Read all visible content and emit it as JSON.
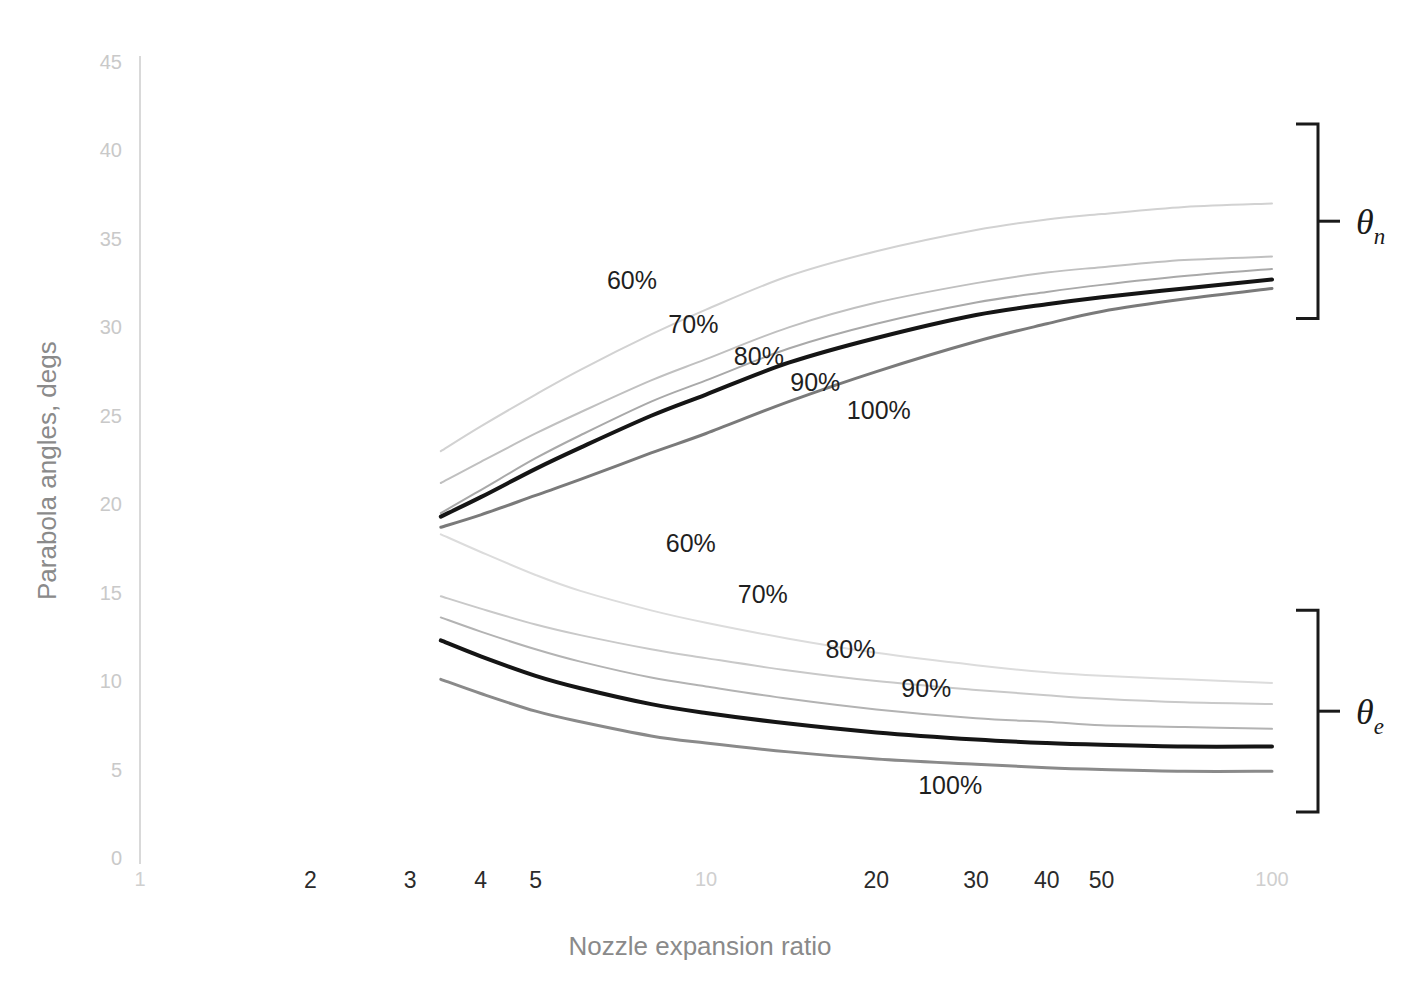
{
  "chart_data": {
    "type": "line",
    "title": "",
    "xlabel": "Nozzle expansion ratio",
    "ylabel": "Parabola angles, degs",
    "xscale": "log",
    "xlim": [
      1,
      100
    ],
    "ylim": [
      0,
      45
    ],
    "grid": false,
    "legend": "inline-curve-labels",
    "y_ticks": [
      "0",
      "5",
      "10",
      "15",
      "20",
      "25",
      "30",
      "35",
      "40",
      "45"
    ],
    "y_tick_values": [
      0,
      5,
      10,
      15,
      20,
      25,
      30,
      35,
      40,
      45
    ],
    "x_ticks": [
      "1",
      "2",
      "3",
      "4",
      "5",
      "10",
      "20",
      "30",
      "40",
      "50",
      "100"
    ],
    "x_tick_values": [
      1,
      2,
      3,
      4,
      5,
      10,
      20,
      30,
      40,
      50,
      100
    ],
    "x_tick_emphasis": [
      "minor",
      "major",
      "major",
      "major",
      "major",
      "minor",
      "major",
      "major",
      "major",
      "major",
      "minor"
    ],
    "groups": [
      {
        "name": "theta_n",
        "label": "θ",
        "subscript": "n",
        "description": "Nozzle initial parabola angle",
        "bracket_top_value": 41.5,
        "bracket_bottom_value": 30.5,
        "series": [
          {
            "name": "60%",
            "label": "60%",
            "color": "#d2d2d2",
            "width": 2,
            "label_x": 7.4,
            "label_y": 32.7,
            "x": [
              3.4,
              4,
              5,
              6,
              8,
              10,
              14,
              20,
              30,
              40,
              50,
              70,
              100
            ],
            "y": [
              23.0,
              24.4,
              26.2,
              27.6,
              29.6,
              31.0,
              32.9,
              34.3,
              35.5,
              36.1,
              36.4,
              36.8,
              37.0
            ]
          },
          {
            "name": "70%",
            "label": "70%",
            "color": "#c0c0c0",
            "width": 2,
            "label_x": 9.5,
            "label_y": 30.2,
            "x": [
              3.4,
              4,
              5,
              6,
              8,
              10,
              14,
              20,
              30,
              40,
              50,
              70,
              100
            ],
            "y": [
              21.2,
              22.4,
              24.0,
              25.2,
              27.0,
              28.2,
              30.0,
              31.4,
              32.5,
              33.1,
              33.4,
              33.8,
              34.0
            ]
          },
          {
            "name": "80%",
            "label": "80%",
            "color": "#a9a9a9",
            "width": 2,
            "label_x": 12.4,
            "label_y": 28.4,
            "x": [
              3.4,
              4,
              5,
              6,
              8,
              10,
              14,
              20,
              30,
              40,
              50,
              70,
              100
            ],
            "y": [
              19.5,
              20.8,
              22.6,
              23.9,
              25.8,
              27.0,
              28.8,
              30.2,
              31.4,
              32.0,
              32.4,
              32.9,
              33.3
            ]
          },
          {
            "name": "90%",
            "label": "90%",
            "color": "#151515",
            "width": 4,
            "label_x": 15.6,
            "label_y": 26.9,
            "x": [
              3.4,
              4,
              5,
              6,
              8,
              10,
              14,
              20,
              30,
              40,
              50,
              70,
              100
            ],
            "y": [
              19.3,
              20.4,
              22.0,
              23.2,
              25.0,
              26.2,
              28.0,
              29.4,
              30.7,
              31.3,
              31.7,
              32.2,
              32.7
            ]
          },
          {
            "name": "100%",
            "label": "100%",
            "color": "#7a7a7a",
            "width": 3,
            "label_x": 20.2,
            "label_y": 25.3,
            "x": [
              3.4,
              4,
              5,
              6,
              8,
              10,
              14,
              20,
              30,
              40,
              50,
              70,
              100
            ],
            "y": [
              18.7,
              19.4,
              20.5,
              21.4,
              22.9,
              24.0,
              25.8,
              27.5,
              29.2,
              30.2,
              30.9,
              31.6,
              32.2
            ]
          }
        ]
      },
      {
        "name": "theta_e",
        "label": "θ",
        "subscript": "e",
        "description": "Nozzle exit parabola angle",
        "bracket_top_value": 14.0,
        "bracket_bottom_value": 2.6,
        "series": [
          {
            "name": "60%",
            "label": "60%",
            "color": "#dcdcdc",
            "width": 2,
            "label_x": 9.4,
            "label_y": 17.8,
            "x": [
              3.4,
              4,
              5,
              6,
              8,
              10,
              14,
              20,
              30,
              40,
              50,
              70,
              100
            ],
            "y": [
              18.3,
              17.3,
              16.0,
              15.1,
              14.0,
              13.3,
              12.4,
              11.6,
              10.9,
              10.5,
              10.3,
              10.1,
              9.9
            ]
          },
          {
            "name": "70%",
            "label": "70%",
            "color": "#c9c9c9",
            "width": 2,
            "label_x": 12.6,
            "label_y": 14.9,
            "x": [
              3.4,
              4,
              5,
              6,
              8,
              10,
              14,
              20,
              30,
              40,
              50,
              70,
              100
            ],
            "y": [
              14.8,
              14.1,
              13.2,
              12.6,
              11.8,
              11.3,
              10.6,
              10.0,
              9.5,
              9.2,
              9.0,
              8.8,
              8.7
            ]
          },
          {
            "name": "80%",
            "label": "80%",
            "color": "#b3b3b3",
            "width": 2,
            "label_x": 18.0,
            "label_y": 11.8,
            "x": [
              3.4,
              4,
              5,
              6,
              8,
              10,
              14,
              20,
              30,
              40,
              50,
              70,
              100
            ],
            "y": [
              13.6,
              12.8,
              11.8,
              11.1,
              10.2,
              9.7,
              9.0,
              8.4,
              7.9,
              7.7,
              7.5,
              7.4,
              7.3
            ]
          },
          {
            "name": "90%",
            "label": "90%",
            "color": "#151515",
            "width": 4,
            "label_x": 24.5,
            "label_y": 9.6,
            "x": [
              3.4,
              4,
              5,
              6,
              8,
              10,
              14,
              20,
              30,
              40,
              50,
              70,
              100
            ],
            "y": [
              12.3,
              11.4,
              10.3,
              9.6,
              8.7,
              8.2,
              7.6,
              7.1,
              6.7,
              6.5,
              6.4,
              6.3,
              6.3
            ]
          },
          {
            "name": "100%",
            "label": "100%",
            "color": "#8a8a8a",
            "width": 3,
            "label_x": 27.0,
            "label_y": 4.1,
            "x": [
              3.4,
              4,
              5,
              6,
              8,
              10,
              14,
              20,
              30,
              40,
              50,
              70,
              100
            ],
            "y": [
              10.1,
              9.3,
              8.3,
              7.7,
              6.9,
              6.5,
              6.0,
              5.6,
              5.3,
              5.1,
              5.0,
              4.9,
              4.9
            ]
          }
        ]
      }
    ]
  }
}
